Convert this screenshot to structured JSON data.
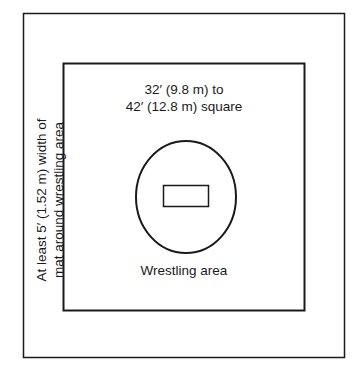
{
  "diagram": {
    "labels": {
      "mat_size_line1": "32′ (9.8 m) to",
      "mat_size_line2": "42′ (12.8 m) square",
      "wrestling_area": "Wrestling area",
      "border_line1": "At least 5′ (1.52 m) width of",
      "border_line2": "mat around wrestling area"
    },
    "colors": {
      "stroke": "#1a1a1a",
      "background": "#ffffff"
    }
  }
}
